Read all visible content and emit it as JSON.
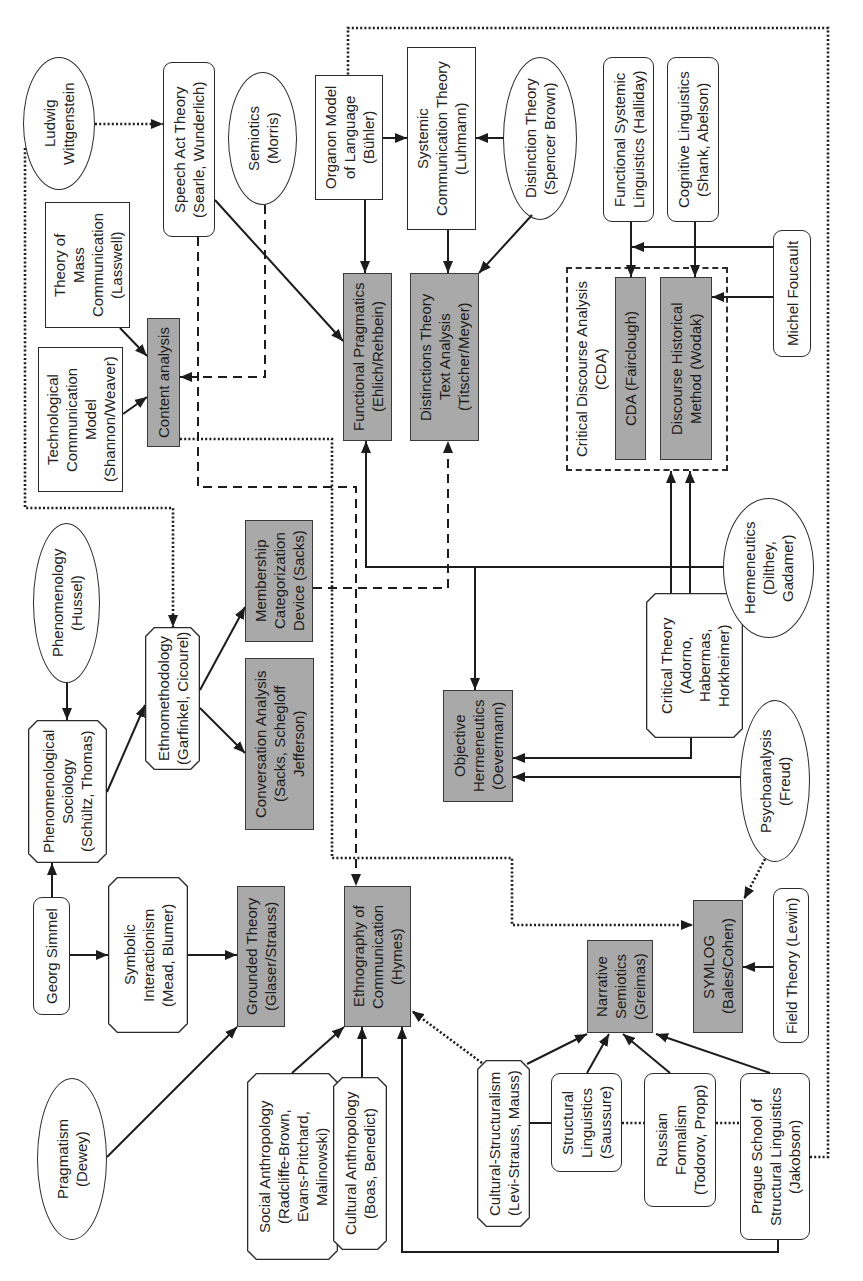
{
  "colors": {
    "method_box_fill": "#a9a9a9",
    "outline": "#2b2b2b",
    "background": "#ffffff"
  },
  "nodes": {
    "wittgenstein": {
      "shape": "ellipse",
      "lines": [
        "Ludwig",
        "Wittgenstein"
      ]
    },
    "speech_act_theory": {
      "shape": "rounded",
      "lines": [
        "Speech Act Theory",
        "(Searle, Wunderlich)"
      ]
    },
    "semiotics": {
      "shape": "ellipse",
      "lines": [
        "Semiotics",
        "(Morris)"
      ]
    },
    "mass_communication": {
      "shape": "rect",
      "lines": [
        "Theory of",
        "Mass",
        "Communication",
        "(Lasswell)"
      ]
    },
    "technological_model": {
      "shape": "rect",
      "lines": [
        "Technological",
        "Communication",
        "Model",
        "(Shannon/Weaver)"
      ]
    },
    "content_analysis": {
      "shape": "method",
      "lines": [
        "Content analysis"
      ]
    },
    "organon_model": {
      "shape": "rect",
      "lines": [
        "Organon Model",
        "of Language",
        "(Bühler)"
      ]
    },
    "systemic_communication": {
      "shape": "rect",
      "lines": [
        "Systemic",
        "Communication Theory",
        "(Luhmann)"
      ]
    },
    "distinction_theory": {
      "shape": "ellipse",
      "lines": [
        "Distinction Theory",
        "(Spencer Brown)"
      ]
    },
    "functional_pragmatics": {
      "shape": "method",
      "lines": [
        "Functional Pragmatics",
        "(Ehlich/Rehbein)"
      ]
    },
    "distinctions_text_analysis": {
      "shape": "method",
      "lines": [
        "Distinctions Theory",
        "Text Analysis",
        "(Titscher/Meyer)"
      ]
    },
    "functional_systemic_linguistics": {
      "shape": "rounded",
      "lines": [
        "Functional Systemic",
        "Linguistics (Halliday)"
      ]
    },
    "cognitive_linguistics": {
      "shape": "rounded",
      "lines": [
        "Cognitive Linguistics",
        "(Shank, Abelson)"
      ]
    },
    "michel_foucault": {
      "shape": "rounded",
      "lines": [
        "Michel Foucault"
      ]
    },
    "cda_fairclough": {
      "shape": "method",
      "lines": [
        "CDA (Fairclough)"
      ]
    },
    "discourse_historical_method": {
      "shape": "method",
      "lines": [
        "Discourse Historical",
        "Method (Wodak)"
      ]
    },
    "phenomenology": {
      "shape": "ellipse",
      "lines": [
        "Phenomenology",
        "(Hussel)"
      ]
    },
    "phenomenological_sociology": {
      "shape": "octagon",
      "lines": [
        "Phenomenological",
        "Sociology",
        "(Schültz, Thomas)"
      ]
    },
    "ethnomethodology": {
      "shape": "octagon",
      "lines": [
        "Ethnomethodology",
        "(Garfinkel, Cicourel)"
      ]
    },
    "membership_categorization": {
      "shape": "method",
      "lines": [
        "Membership",
        "Categorization",
        "Device (Sacks)"
      ]
    },
    "conversation_analysis": {
      "shape": "method",
      "lines": [
        "Conversation Analysis",
        "(Sacks, Schegloff",
        "Jefferson)"
      ]
    },
    "objective_hermeneutics": {
      "shape": "method",
      "lines": [
        "Objective",
        "Hermeneutics",
        "(Oevermann)"
      ]
    },
    "critical_theory": {
      "shape": "octagon",
      "lines": [
        "Critical Theory",
        "(Adorno,",
        "Habermas,",
        "Horkheimer)"
      ]
    },
    "hermeneutics": {
      "shape": "ellipse",
      "lines": [
        "Hermeneutics",
        "(Dilthey,",
        "Gadamer)"
      ]
    },
    "psychoanalysis": {
      "shape": "ellipse",
      "lines": [
        "Psychoanalysis",
        "(Freud)"
      ]
    },
    "georg_simmel": {
      "shape": "rounded",
      "lines": [
        "Georg Simmel"
      ]
    },
    "symbolic_interactionism": {
      "shape": "octagon",
      "lines": [
        "Symbolic",
        "Interactionism",
        "(Mead, Blumer)"
      ]
    },
    "grounded_theory": {
      "shape": "method",
      "lines": [
        "Grounded Theory",
        "(Glaser/Strauss)"
      ]
    },
    "pragmatism": {
      "shape": "ellipse",
      "lines": [
        "Pragmatism",
        "(Dewey)"
      ]
    },
    "social_anthropology": {
      "shape": "octagon",
      "lines": [
        "Social Anthropology",
        "(Radcliffe-Brown,",
        "Evans-Pritchard,",
        "Malinowski)"
      ]
    },
    "cultural_anthropology": {
      "shape": "octagon",
      "lines": [
        "Cultural Anthropology",
        "(Boas, Benedict)"
      ]
    },
    "ethnography_of_communication": {
      "shape": "method",
      "lines": [
        "Ethnography of",
        "Communication",
        "(Hymes)"
      ]
    },
    "cultural_structuralism": {
      "shape": "octagon",
      "lines": [
        "Cultural-Structuralism",
        "(Levi-Strauss, Mauss)"
      ]
    },
    "structural_linguistics": {
      "shape": "rounded",
      "lines": [
        "Structural",
        "Linguistics",
        "(Saussure)"
      ]
    },
    "russian_formalism": {
      "shape": "rounded",
      "lines": [
        "Russian",
        "Formalism",
        "(Todorov, Propp)"
      ]
    },
    "prague_school": {
      "shape": "rounded",
      "lines": [
        "Prague School of",
        "Structural Linguistics",
        "(Jakobson)"
      ]
    },
    "narrative_semiotics": {
      "shape": "method",
      "lines": [
        "Narrative",
        "Semiotics",
        "(Greimas)"
      ]
    },
    "symlog": {
      "shape": "method",
      "lines": [
        "SYMLOG",
        "(Bales/Cohen)"
      ]
    },
    "field_theory": {
      "shape": "rounded",
      "lines": [
        "Field Theory (Lewin)"
      ]
    }
  },
  "groups": {
    "cda": {
      "label_lines": [
        "Critical Discourse Analysis",
        "(CDA)"
      ],
      "members": [
        "cda_fairclough",
        "discourse_historical_method"
      ]
    }
  },
  "edges": [
    {
      "from": "wittgenstein",
      "to": "speech_act_theory",
      "style": "dotted-arrow"
    },
    {
      "from": "wittgenstein",
      "to": "ethnomethodology",
      "style": "dotted-arrow"
    },
    {
      "from": "speech_act_theory",
      "to": "functional_pragmatics",
      "style": "solid-arrow"
    },
    {
      "from": "speech_act_theory",
      "to": "ethnography_of_communication",
      "style": "dashed-arrow"
    },
    {
      "from": "semiotics",
      "to": "content_analysis",
      "style": "dashed-arrow"
    },
    {
      "from": "mass_communication",
      "to": "content_analysis",
      "style": "solid-arrow"
    },
    {
      "from": "technological_model",
      "to": "content_analysis",
      "style": "solid-arrow"
    },
    {
      "from": "content_analysis",
      "to": "symlog",
      "style": "dotted-arrow"
    },
    {
      "from": "organon_model",
      "to": "functional_pragmatics",
      "style": "solid-arrow"
    },
    {
      "from": "organon_model",
      "to": "systemic_communication",
      "style": "solid-arrow"
    },
    {
      "from": "distinction_theory",
      "to": "systemic_communication",
      "style": "solid-arrow"
    },
    {
      "from": "systemic_communication",
      "to": "distinctions_text_analysis",
      "style": "solid-arrow"
    },
    {
      "from": "distinction_theory",
      "to": "distinctions_text_analysis",
      "style": "solid-arrow"
    },
    {
      "from": "functional_systemic_linguistics",
      "to": "cda_fairclough",
      "style": "solid-arrow"
    },
    {
      "from": "cognitive_linguistics",
      "to": "discourse_historical_method",
      "style": "solid-arrow"
    },
    {
      "from": "michel_foucault",
      "to": "cda_fairclough",
      "style": "solid-arrow"
    },
    {
      "from": "michel_foucault",
      "to": "discourse_historical_method",
      "style": "solid-arrow"
    },
    {
      "from": "hermeneutics",
      "to": "functional_pragmatics",
      "style": "solid-arrow"
    },
    {
      "from": "hermeneutics",
      "to": "objective_hermeneutics",
      "style": "solid-arrow"
    },
    {
      "from": "critical_theory",
      "to": "cda",
      "style": "solid-arrow-double"
    },
    {
      "from": "critical_theory",
      "to": "objective_hermeneutics",
      "style": "solid-arrow"
    },
    {
      "from": "psychoanalysis",
      "to": "objective_hermeneutics",
      "style": "solid-arrow"
    },
    {
      "from": "psychoanalysis",
      "to": "symlog",
      "style": "dotted-arrow"
    },
    {
      "from": "field_theory",
      "to": "symlog",
      "style": "solid-arrow"
    },
    {
      "from": "membership_categorization",
      "to": "distinctions_text_analysis",
      "style": "dashed-arrow"
    },
    {
      "from": "phenomenology",
      "to": "phenomenological_sociology",
      "style": "solid-arrow"
    },
    {
      "from": "georg_simmel",
      "to": "phenomenological_sociology",
      "style": "solid-arrow"
    },
    {
      "from": "phenomenological_sociology",
      "to": "ethnomethodology",
      "style": "solid-arrow"
    },
    {
      "from": "ethnomethodology",
      "to": "membership_categorization",
      "style": "solid-arrow"
    },
    {
      "from": "ethnomethodology",
      "to": "conversation_analysis",
      "style": "solid-arrow"
    },
    {
      "from": "georg_simmel",
      "to": "symbolic_interactionism",
      "style": "solid-arrow"
    },
    {
      "from": "symbolic_interactionism",
      "to": "grounded_theory",
      "style": "solid-arrow"
    },
    {
      "from": "pragmatism",
      "to": "grounded_theory",
      "style": "solid-arrow"
    },
    {
      "from": "social_anthropology",
      "to": "ethnography_of_communication",
      "style": "solid-arrow"
    },
    {
      "from": "cultural_anthropology",
      "to": "ethnography_of_communication",
      "style": "solid-arrow"
    },
    {
      "from": "prague_school",
      "to": "ethnography_of_communication",
      "style": "solid-arrow"
    },
    {
      "from": "cultural_structuralism",
      "to": "ethnography_of_communication",
      "style": "dotted-arrow"
    },
    {
      "from": "cultural_structuralism",
      "to": "narrative_semiotics",
      "style": "solid-arrow"
    },
    {
      "from": "structural_linguistics",
      "to": "narrative_semiotics",
      "style": "solid-arrow"
    },
    {
      "from": "russian_formalism",
      "to": "narrative_semiotics",
      "style": "solid-arrow"
    },
    {
      "from": "prague_school",
      "to": "narrative_semiotics",
      "style": "solid-arrow"
    },
    {
      "from": "cultural_structuralism",
      "to": "structural_linguistics",
      "style": "solid-line"
    },
    {
      "from": "structural_linguistics",
      "to": "russian_formalism",
      "style": "dotted-line"
    },
    {
      "from": "russian_formalism",
      "to": "prague_school",
      "style": "dotted-line"
    },
    {
      "from": "prague_school",
      "to": "organon_model",
      "style": "dotted-line"
    }
  ]
}
